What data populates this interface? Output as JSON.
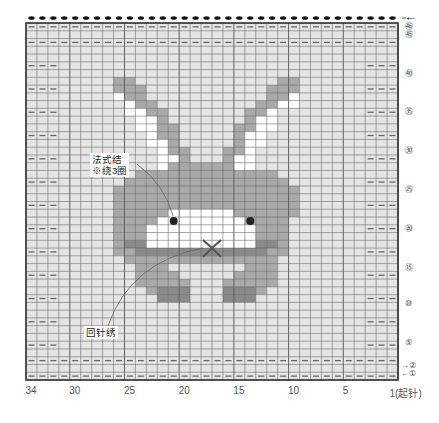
{
  "chart": {
    "columns": 34,
    "rows": 46,
    "colors": {
      "background_cell": "#e4e4e4",
      "body_gray": "#a9a9a9",
      "dark_gray": "#8a8a8a",
      "white": "#ffffff",
      "grid_line": "#555555",
      "frame": "#333333",
      "purl_mark": "#666666",
      "eye": "#222222"
    },
    "legend_key": {
      ".": "background",
      "g": "body gray",
      "d": "dark gray",
      "w": "white"
    },
    "cell_rows_top_to_bottom": [
      "..................................",
      "..................................",
      "..................................",
      "..................................",
      "..................................",
      "..................................",
      "..................................",
      "........gg.............gg.........",
      "........ggg...........ggg.........",
      "........wgg...........ggw.........",
      ".........wgg.........ggww.........",
      ".........wwgg.......ggw...........",
      "..........wwg.......gww...........",
      "..........wwgg.....ggww...........",
      "...........wgg.....gww............",
      "...........wwg.....gww............",
      "............wgg...ggw.............",
      "............wwg...gww.............",
      "............wggggggww.............",
      "..........ggggggggggggg...........",
      ".........ggggggggggggggg..........",
      "........ggggggggggggggggg.........",
      "........ggggggggggggggggg.........",
      "........ggggggggggggggggg.........",
      "........gggggwwwwwwgggggg.........",
      "........ggggwwwwwwwwgggg..........",
      "........gggwwwwwwwwwwggg..........",
      "........gggwwwwwwwwwwggg..........",
      "........gddwwwwwwwwwwddg..........",
      "........ggddddddddddddgg..........",
      ".........gggggggggggggg...........",
      "..........ggg.......ggg...........",
      "..........gggg.....gggg...........",
      "..........ggggg...ggggg...........",
      "...........gddd...dddg............",
      "............ddd...ddd.............",
      "..................................",
      "..................................",
      "..................................",
      "..................................",
      "..................................",
      "..................................",
      "..................................",
      "..................................",
      "..................................",
      ".................................."
    ],
    "purl_rows_full_width_from_top": [
      0,
      2,
      43,
      45
    ],
    "purl_rows_edges_from_top": [
      5,
      8,
      11,
      14,
      17,
      20,
      23,
      26,
      29,
      32,
      35,
      38,
      41
    ],
    "edge_purl_columns": 3,
    "top_bind_off_dots": 34,
    "eyes": [
      {
        "col_from_left": 13.5,
        "row_from_top": 25.5
      },
      {
        "col_from_left": 20.5,
        "row_from_top": 25.5
      }
    ],
    "nose_x": {
      "col_from_left": 17,
      "row_from_top": 29
    }
  },
  "row_labels": [
    {
      "text": "㊻",
      "row": 46
    },
    {
      "text": "㊺",
      "row": 45
    },
    {
      "text": "㊵",
      "row": 40
    },
    {
      "text": "㉟",
      "row": 35
    },
    {
      "text": "㉚",
      "row": 30
    },
    {
      "text": "㉕",
      "row": 25
    },
    {
      "text": "⑳",
      "row": 20
    },
    {
      "text": "⑮",
      "row": 15
    },
    {
      "text": "⑩",
      "row": 10
    },
    {
      "text": "⑤",
      "row": 5
    },
    {
      "text": "→②",
      "row": 2
    },
    {
      "text": "←①",
      "row": 1
    }
  ],
  "column_labels": [
    {
      "text": "34",
      "col": 34
    },
    {
      "text": "30",
      "col": 30
    },
    {
      "text": "25",
      "col": 25
    },
    {
      "text": "20",
      "col": 20
    },
    {
      "text": "15",
      "col": 15
    },
    {
      "text": "10",
      "col": 10
    },
    {
      "text": "5",
      "col": 5
    },
    {
      "text": "1(起针)",
      "col": 1
    }
  ],
  "top_arrow": "←",
  "callouts": {
    "french_knot_line1": "法式结",
    "french_knot_line2": "※绕3圈",
    "backstitch": "回针绣"
  }
}
